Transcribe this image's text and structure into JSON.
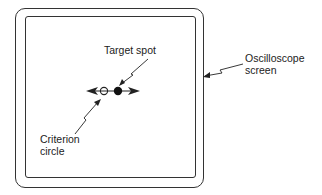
{
  "diagram": {
    "labels": {
      "target_spot": "Target spot",
      "oscilloscope_line1": "Oscilloscope",
      "oscilloscope_line2": "screen",
      "criterion_line1": "Criterion",
      "criterion_line2": "circle"
    },
    "elements": {
      "criterion_circle": "open circle",
      "target_spot": "filled dot",
      "arrows": [
        "left",
        "right"
      ]
    },
    "colors": {
      "ink": "#222222",
      "background": "#ffffff"
    }
  }
}
